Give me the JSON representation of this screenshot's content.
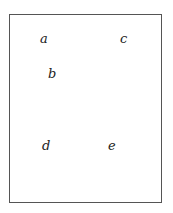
{
  "diagram": {
    "frame": {
      "border_color": "#555555"
    },
    "labels": [
      {
        "id": "a",
        "text": "a",
        "x": 40,
        "y": 32
      },
      {
        "id": "c",
        "text": "c",
        "x": 120,
        "y": 32
      },
      {
        "id": "b",
        "text": "b",
        "x": 48,
        "y": 67
      },
      {
        "id": "d",
        "text": "d",
        "x": 42,
        "y": 139
      },
      {
        "id": "e",
        "text": "e",
        "x": 108,
        "y": 139
      }
    ]
  }
}
